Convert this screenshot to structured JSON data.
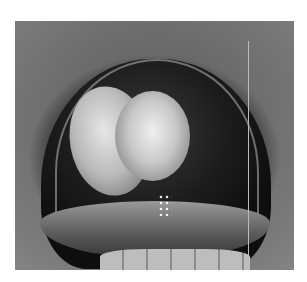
{
  "image": {
    "description": "Grayscale clinical photograph of an open mouth showing a palatal lesion",
    "background_color": "#ffffff"
  }
}
